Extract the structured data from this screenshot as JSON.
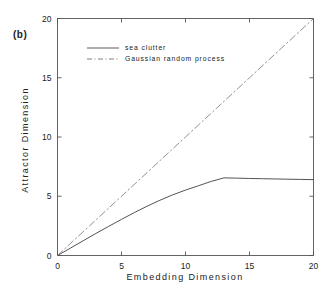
{
  "figure": {
    "panel_label": "(b)",
    "background_color": "#ffffff",
    "axis_color": "#555555",
    "text_color": "#222222"
  },
  "chart_data": {
    "type": "line",
    "title": "",
    "panel": "(b)",
    "xlabel": "Embedding Dimension",
    "ylabel": "Attractor Dimension",
    "xlim": [
      0,
      20
    ],
    "ylim": [
      0,
      20
    ],
    "xticks": [
      0,
      5,
      10,
      15,
      20
    ],
    "yticks": [
      0,
      5,
      10,
      15,
      20
    ],
    "xtick_labels": [
      "0",
      "5",
      "10",
      "15",
      "20"
    ],
    "ytick_labels": [
      "0",
      "5",
      "10",
      "15",
      "20"
    ],
    "grid": false,
    "legend_position": "upper-left-inside",
    "series": [
      {
        "name": "sea clutter",
        "style": "solid",
        "color": "#4a4a4a",
        "x": [
          0,
          1,
          2,
          3,
          4,
          5,
          6,
          7,
          8,
          9,
          10,
          11,
          12,
          13,
          14,
          15,
          16,
          17,
          18,
          19,
          20
        ],
        "y": [
          0.0,
          0.62,
          1.24,
          1.86,
          2.46,
          3.05,
          3.62,
          4.16,
          4.66,
          5.12,
          5.52,
          5.88,
          6.25,
          6.55,
          6.53,
          6.5,
          6.48,
          6.46,
          6.44,
          6.42,
          6.4
        ]
      },
      {
        "name": "Gaussian random process",
        "style": "dash-dot",
        "color": "#8a8a8a",
        "x": [
          0,
          2.5,
          5,
          7.5,
          10,
          12.5,
          15,
          17.5,
          20
        ],
        "y": [
          0.0,
          2.5,
          5.0,
          7.5,
          10.0,
          12.5,
          15.0,
          17.5,
          20.0
        ]
      }
    ]
  },
  "legend": {
    "items": [
      {
        "label": "sea clutter",
        "style": "solid"
      },
      {
        "label": "Gaussian random process",
        "style": "dash-dot"
      }
    ]
  }
}
